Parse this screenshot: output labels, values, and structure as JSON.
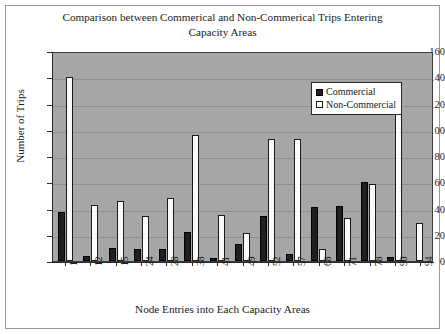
{
  "chart_data": {
    "type": "bar",
    "title": "Comparison between Commerical and Non-Commerical Trips Entering Capacity Areas",
    "title_line1": "Comparison between Commerical and Non-Commerical Trips Entering",
    "title_line2": "Capacity Areas",
    "xlabel": "Node Entries into Each Capacity Areas",
    "ylabel": "Number of Trips",
    "ylim": [
      0,
      160
    ],
    "yticks": [
      0,
      20,
      40,
      60,
      80,
      100,
      120,
      140,
      160
    ],
    "grid": true,
    "legend_position": "top-right",
    "categories": [
      "1",
      "12",
      "15",
      "24",
      "28",
      "38",
      "41",
      "49",
      "52",
      "57",
      "68",
      "71",
      "78",
      "90",
      "94"
    ],
    "series": [
      {
        "name": "Commercial",
        "color": "#1f1f1f",
        "values": [
          37,
          4,
          10,
          9,
          9,
          22,
          2,
          13,
          34,
          5,
          41,
          42,
          60,
          3,
          0
        ]
      },
      {
        "name": "Non-Commercial",
        "color": "#ffffff",
        "values": [
          140,
          43,
          46,
          34,
          48,
          96,
          35,
          21,
          93,
          93,
          9,
          33,
          59,
          115,
          29
        ]
      }
    ],
    "plot_background": "#a6a6a6",
    "figure_background": "#ffffff"
  },
  "legend": {
    "items": [
      {
        "label": "Commercial",
        "swatch": "commercial"
      },
      {
        "label": "Non-Commercial",
        "swatch": "noncommercial"
      }
    ]
  }
}
